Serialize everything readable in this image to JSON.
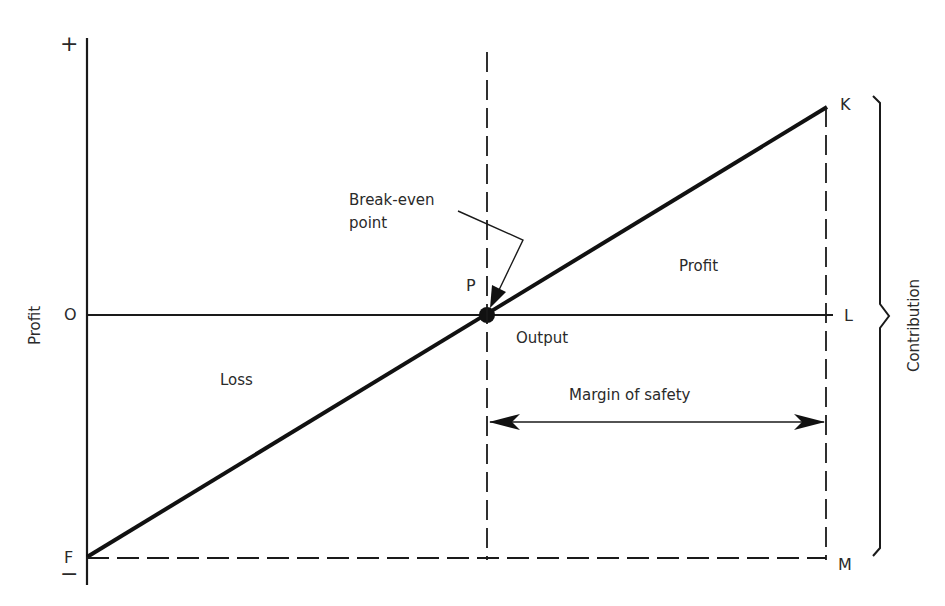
{
  "diagram": {
    "type": "profit-volume break-even chart",
    "y_axis": {
      "label": "Profit",
      "top_sign": "+",
      "bottom_sign": "−"
    },
    "points": {
      "origin": "O",
      "fixed_cost": "F",
      "break_even": "P",
      "max_contribution": "K",
      "output_end": "L",
      "bottom_right": "M"
    },
    "labels": {
      "break_even": "Break-even point",
      "break_even_line1": "Break-even",
      "break_even_line2": "point",
      "profit_region": "Profit",
      "loss_region": "Loss",
      "x_axis": "Output",
      "margin_of_safety": "Margin of safety",
      "contribution": "Contribution"
    },
    "colors": {
      "line": "#1a1a1a",
      "text": "#2a2a2a",
      "background": "#ffffff"
    }
  }
}
